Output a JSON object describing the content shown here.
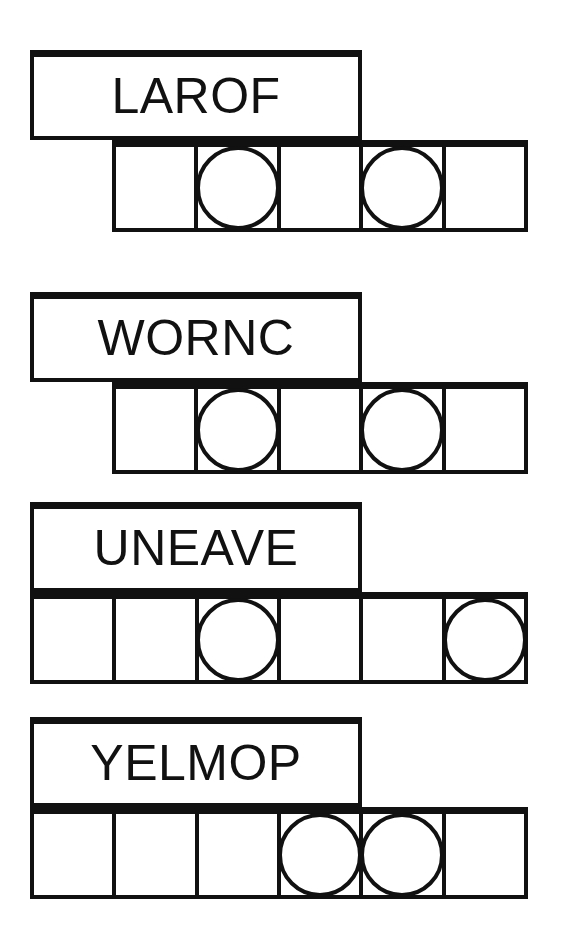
{
  "page": {
    "background_color": "#ffffff",
    "ink_color": "#111111"
  },
  "puzzles": [
    {
      "id": "puzzle-1",
      "scrambled_word": "LAROF",
      "letter_count": 5,
      "answer_cells": 5,
      "circled_cell_indices": [
        2,
        4
      ],
      "word_box": {
        "x": 30,
        "y": 50,
        "width": 332,
        "height": 90
      },
      "answer_row": {
        "x": 112,
        "y": 140,
        "width": 416,
        "height": 92
      }
    },
    {
      "id": "puzzle-2",
      "scrambled_word": "WORNC",
      "letter_count": 5,
      "answer_cells": 5,
      "circled_cell_indices": [
        2,
        4
      ],
      "word_box": {
        "x": 30,
        "y": 292,
        "width": 332,
        "height": 90
      },
      "answer_row": {
        "x": 112,
        "y": 382,
        "width": 416,
        "height": 92
      }
    },
    {
      "id": "puzzle-3",
      "scrambled_word": "UNEAVE",
      "letter_count": 6,
      "answer_cells": 6,
      "circled_cell_indices": [
        3,
        6
      ],
      "word_box": {
        "x": 30,
        "y": 502,
        "width": 332,
        "height": 90
      },
      "answer_row": {
        "x": 30,
        "y": 592,
        "width": 498,
        "height": 92
      }
    },
    {
      "id": "puzzle-4",
      "scrambled_word": "YELMOP",
      "letter_count": 6,
      "answer_cells": 6,
      "circled_cell_indices": [
        4,
        5
      ],
      "word_box": {
        "x": 30,
        "y": 717,
        "width": 332,
        "height": 90
      },
      "answer_row": {
        "x": 30,
        "y": 807,
        "width": 498,
        "height": 92
      }
    }
  ]
}
